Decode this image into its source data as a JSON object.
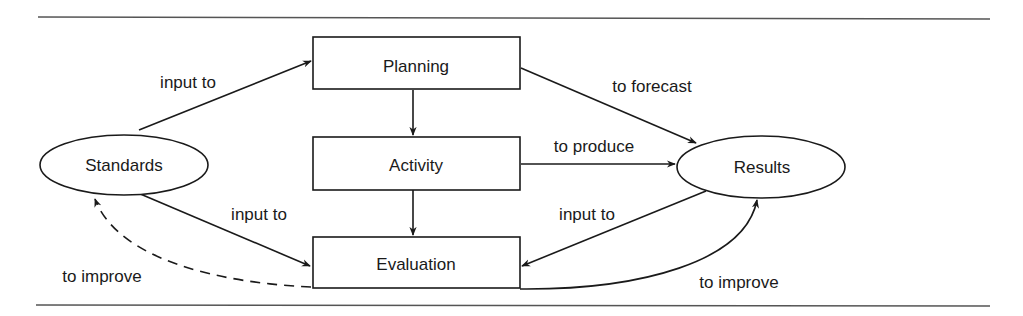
{
  "diagram": {
    "nodes": {
      "standards": {
        "label": "Standards",
        "shape": "ellipse"
      },
      "planning": {
        "label": "Planning",
        "shape": "rectangle"
      },
      "activity": {
        "label": "Activity",
        "shape": "rectangle"
      },
      "evaluation": {
        "label": "Evaluation",
        "shape": "rectangle"
      },
      "results": {
        "label": "Results",
        "shape": "ellipse"
      }
    },
    "edges": [
      {
        "from": "Standards",
        "to": "Planning",
        "label": "input to",
        "style": "solid"
      },
      {
        "from": "Planning",
        "to": "Results",
        "label": "to forecast",
        "style": "solid"
      },
      {
        "from": "Planning",
        "to": "Activity",
        "label": "",
        "style": "solid"
      },
      {
        "from": "Activity",
        "to": "Results",
        "label": "to produce",
        "style": "solid"
      },
      {
        "from": "Activity",
        "to": "Evaluation",
        "label": "",
        "style": "solid"
      },
      {
        "from": "Standards",
        "to": "Evaluation",
        "label": "input to",
        "style": "solid"
      },
      {
        "from": "Results",
        "to": "Evaluation",
        "label": "input to",
        "style": "solid"
      },
      {
        "from": "Evaluation",
        "to": "Standards",
        "label": "to improve",
        "style": "dashed"
      },
      {
        "from": "Evaluation",
        "to": "Results",
        "label": "to improve",
        "style": "solid"
      }
    ],
    "labels": {
      "standards_to_planning": "input to",
      "planning_to_results": "to forecast",
      "activity_to_results": "to produce",
      "standards_to_evaluation": "input to",
      "results_to_evaluation": "input to",
      "evaluation_to_standards": "to improve",
      "evaluation_to_results": "to improve"
    },
    "colors": {
      "stroke": "#1a1a1a",
      "background": "#ffffff",
      "rule": "#555555"
    }
  }
}
